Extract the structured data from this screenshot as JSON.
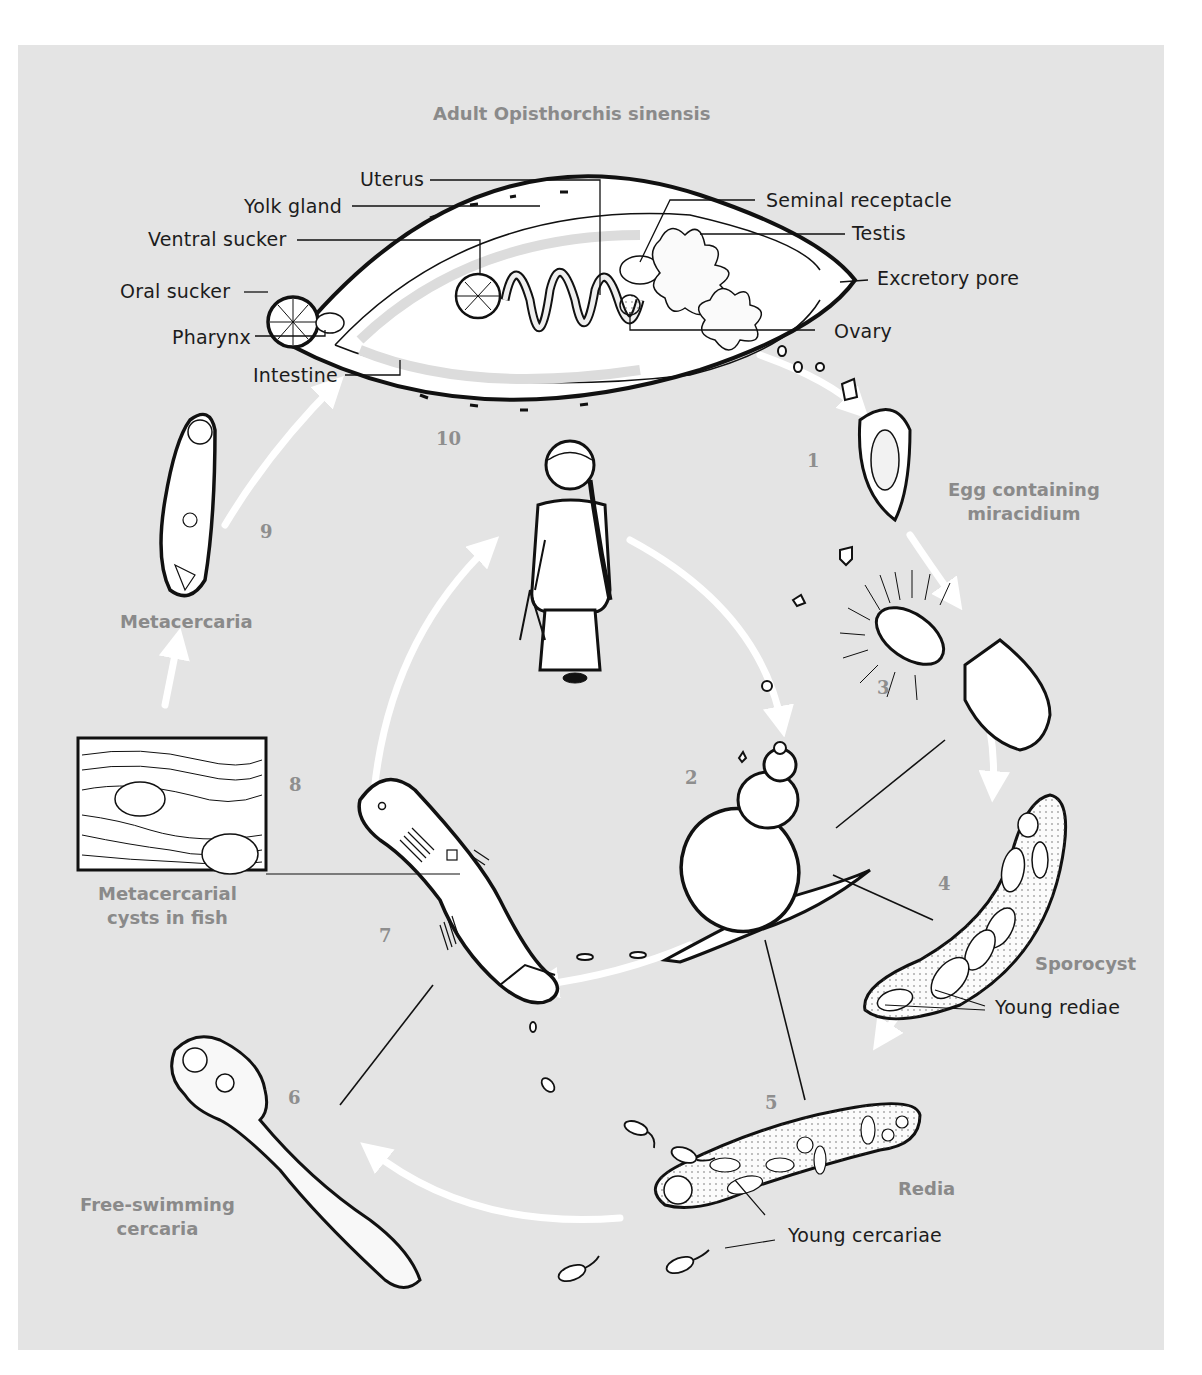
{
  "diagram": {
    "title": "Adult Opisthorchis sinensis",
    "colors": {
      "background": "#e4e4e4",
      "page": "#ffffff",
      "ink": "#111111",
      "stage_label": "#8a8a8a",
      "arrow": "#ffffff"
    },
    "adult_anatomy_labels": [
      {
        "id": "uterus",
        "text": "Uterus"
      },
      {
        "id": "yolk-gland",
        "text": "Yolk gland"
      },
      {
        "id": "ventral-sucker",
        "text": "Ventral sucker"
      },
      {
        "id": "oral-sucker",
        "text": "Oral sucker"
      },
      {
        "id": "pharynx",
        "text": "Pharynx"
      },
      {
        "id": "intestine",
        "text": "Intestine"
      },
      {
        "id": "seminal-receptacle",
        "text": "Seminal receptacle"
      },
      {
        "id": "testis",
        "text": "Testis"
      },
      {
        "id": "excretory-pore",
        "text": "Excretory pore"
      },
      {
        "id": "ovary",
        "text": "Ovary"
      }
    ],
    "stages": [
      {
        "id": "egg",
        "text": "Egg containing\nmiracidium"
      },
      {
        "id": "sporocyst",
        "text": "Sporocyst"
      },
      {
        "id": "redia",
        "text": "Redia"
      },
      {
        "id": "cercaria",
        "text": "Free-swimming\ncercaria"
      },
      {
        "id": "cysts",
        "text": "Metacercarial\ncysts in fish"
      },
      {
        "id": "metacercaria",
        "text": "Metacercaria"
      }
    ],
    "sub_labels": [
      {
        "id": "young-rediae",
        "text": "Young rediae"
      },
      {
        "id": "young-cercariae",
        "text": "Young cercariae"
      }
    ],
    "step_numbers": [
      "1",
      "2",
      "3",
      "4",
      "5",
      "6",
      "7",
      "8",
      "9",
      "10"
    ],
    "icons": [
      "adult-fluke-icon",
      "egg-icon",
      "miracidium-icon",
      "snail-icon",
      "sporocyst-icon",
      "redia-icon",
      "cercaria-icon",
      "fish-icon",
      "fish-tissue-cyst-icon",
      "metacercaria-icon",
      "human-host-icon",
      "cycle-arrow-icon"
    ]
  }
}
